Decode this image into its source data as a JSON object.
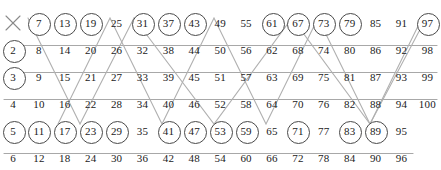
{
  "figure": {
    "columns": 17,
    "rows": 6,
    "layout": "numbers 1 to 100 laid out in 6 rows, column step 6",
    "colors": {
      "number": "#1a1a1a",
      "circle": "#4a4a4a",
      "strike": "#9a9a9a",
      "background": "#ffffff"
    }
  },
  "chart_data": {
    "type": "table",
    "xlabel": "",
    "ylabel": "",
    "rows": [
      {
        "index": 1,
        "values": [
          1,
          7,
          13,
          19,
          25,
          31,
          37,
          43,
          49,
          55,
          61,
          67,
          73,
          79,
          85,
          91,
          97
        ],
        "circled": [
          7,
          13,
          19,
          31,
          37,
          43,
          61,
          67,
          73,
          79,
          97
        ],
        "crossed": [
          1
        ],
        "row_strike": false
      },
      {
        "index": 2,
        "values": [
          2,
          8,
          14,
          20,
          26,
          32,
          38,
          44,
          50,
          56,
          62,
          68,
          74,
          80,
          86,
          92,
          98
        ],
        "circled": [
          2
        ],
        "crossed": [],
        "row_strike": true,
        "strike_from": 8
      },
      {
        "index": 3,
        "values": [
          3,
          9,
          15,
          21,
          27,
          33,
          39,
          45,
          51,
          57,
          63,
          69,
          75,
          81,
          87,
          93,
          99
        ],
        "circled": [
          3
        ],
        "crossed": [],
        "row_strike": true,
        "strike_from": 9
      },
      {
        "index": 4,
        "values": [
          4,
          10,
          16,
          22,
          28,
          34,
          40,
          46,
          52,
          58,
          64,
          70,
          76,
          82,
          88,
          94,
          100
        ],
        "circled": [],
        "crossed": [],
        "row_strike": true,
        "strike_from": 4
      },
      {
        "index": 5,
        "values": [
          5,
          11,
          17,
          23,
          29,
          35,
          41,
          47,
          53,
          59,
          65,
          71,
          77,
          83,
          89,
          95
        ],
        "circled": [
          5,
          11,
          17,
          23,
          29,
          41,
          47,
          53,
          59,
          71,
          83,
          89
        ],
        "crossed": [],
        "row_strike": false
      },
      {
        "index": 6,
        "values": [
          6,
          12,
          18,
          24,
          30,
          36,
          42,
          48,
          54,
          60,
          66,
          72,
          78,
          84,
          90,
          96
        ],
        "circled": [],
        "crossed": [],
        "row_strike": true,
        "strike_from": 6
      }
    ],
    "primes_circled": [
      2,
      3,
      5,
      7,
      11,
      13,
      17,
      19,
      23,
      29,
      31,
      37,
      41,
      43,
      47,
      53,
      59,
      61,
      67,
      71,
      73,
      79,
      83,
      89,
      97
    ],
    "diagonal_strikes": {
      "multiples_of_5": [
        5,
        25,
        35,
        55,
        65,
        85,
        95
      ],
      "multiples_of_7": [
        7,
        35,
        49,
        77,
        91
      ]
    },
    "annotations": [
      "1 is crossed out with an X",
      "rows 2, 3, 4 and 6 carry a horizontal strike line",
      "zig-zag diagonals strike the multiples of 5 and of 7"
    ]
  }
}
